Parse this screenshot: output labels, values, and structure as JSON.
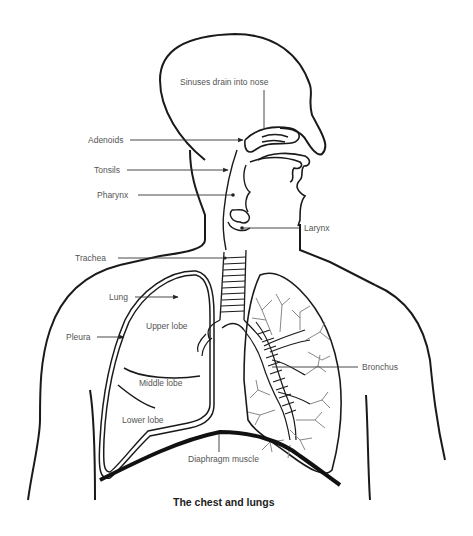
{
  "diagram": {
    "caption": "The chest and lungs",
    "labels": {
      "sinuses": "Sinuses drain into nose",
      "adenoids": "Adenoids",
      "tonsils": "Tonsils",
      "pharynx": "Pharynx",
      "larynx": "Larynx",
      "trachea": "Trachea",
      "lung": "Lung",
      "pleura": "Pleura",
      "upper_lobe": "Upper lobe",
      "middle_lobe": "Middle lobe",
      "lower_lobe": "Lower lobe",
      "bronchus": "Bronchus",
      "diaphragm": "Diaphragm muscle"
    },
    "colors": {
      "outline": "#1a1a1a",
      "label_text": "#555555",
      "leader_line": "#333333",
      "bronchiole": "#888888",
      "background": "#ffffff"
    }
  }
}
